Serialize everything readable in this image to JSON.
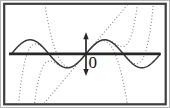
{
  "chart_data": {
    "type": "line",
    "origin_label": "0",
    "x_axis": {
      "tick_labels": [
        "0"
      ],
      "visible_range_radians": [
        -6.9,
        6.9
      ],
      "sine_zeros_radians": [
        -6.2832,
        -3.1416,
        0,
        3.1416,
        6.2832
      ],
      "arrowheads": "none"
    },
    "y_axis": {
      "tick_labels": [],
      "visible_range_units": [
        -3.6,
        3.6
      ],
      "arrowheads": "both-ends"
    },
    "series": [
      {
        "name": "sin",
        "label": "y = sin x",
        "style": "solid",
        "fn": "sin",
        "range": [
          -6.2832,
          6.2832
        ],
        "key_points": [
          [
            -6.2832,
            0
          ],
          [
            -4.7124,
            1
          ],
          [
            -3.1416,
            0
          ],
          [
            -1.5708,
            -1
          ],
          [
            0,
            0
          ],
          [
            1.5708,
            1
          ],
          [
            3.1416,
            0
          ],
          [
            4.7124,
            -1
          ],
          [
            6.2832,
            0
          ]
        ]
      },
      {
        "name": "t1",
        "label": "T1(x) = x",
        "style": "dotted",
        "coeffs": [
          0,
          1
        ],
        "range": [
          -6.9,
          6.9
        ]
      },
      {
        "name": "t3",
        "label": "T3(x) = x - x^3/6",
        "style": "dotted",
        "coeffs": [
          0,
          1,
          0,
          -0.16666667
        ],
        "range": [
          -6.9,
          6.9
        ]
      },
      {
        "name": "t5",
        "label": "T5(x) = x - x^3/6 + x^5/120",
        "style": "dotted",
        "coeffs": [
          0,
          1,
          0,
          -0.16666667,
          0,
          0.00833333
        ],
        "range": [
          -6.9,
          6.9
        ]
      },
      {
        "name": "t9",
        "label": "T9(x) = x - x^3/6 + x^5/120 - x^7/5040 + x^9/362880",
        "style": "dotted",
        "coeffs": [
          0,
          1,
          0,
          -0.16666667,
          0,
          0.00833333,
          0,
          -0.000198413,
          0,
          2.7557e-06
        ],
        "range": [
          -6.9,
          6.9
        ]
      }
    ],
    "layout_hints": {
      "origin_px": [
        85.5,
        53.5
      ],
      "px_per_radian": 11.86,
      "px_per_unit": 14,
      "x_axis_span_px": [
        8.5,
        160
      ],
      "y_axis_span_px": [
        32,
        75.5
      ],
      "frame_px": {
        "x": 4,
        "y": 3.5,
        "width": 161.5,
        "height": 100.5
      },
      "grid": "off",
      "legend": "none"
    },
    "colors": {
      "background": "#ffffff",
      "outer_edge": "#b5b5b5",
      "frame": "#3d3d3d",
      "curve": "#3a3a3a",
      "dotted": "#909090",
      "axis": "#262626",
      "label": "#111111"
    }
  }
}
